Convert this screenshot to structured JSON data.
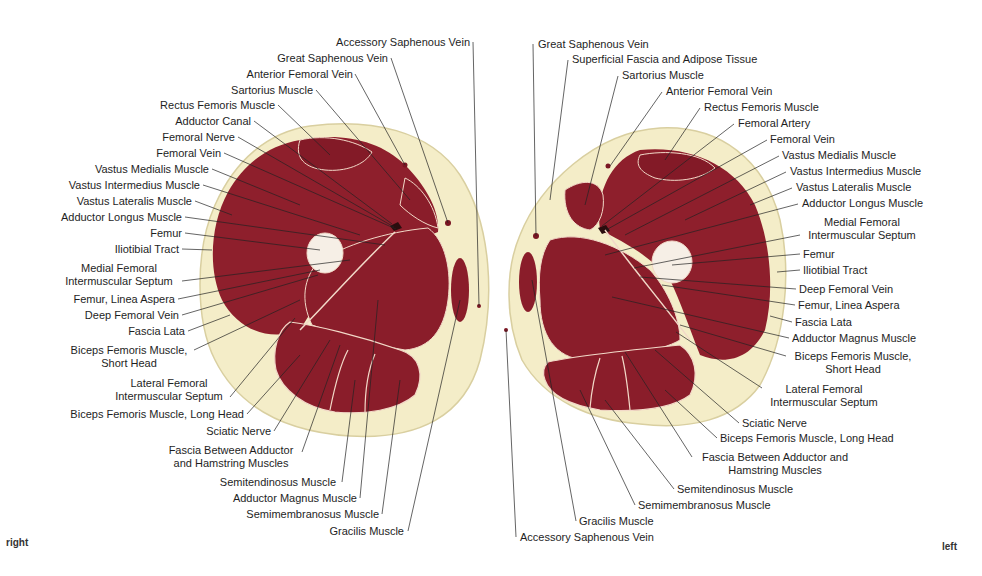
{
  "figure": {
    "side_labels": {
      "right": "right",
      "left": "left"
    },
    "colors": {
      "muscle": "#8e1f2c",
      "muscle_dark": "#7a1623",
      "fat": "#f4edc8",
      "fat_edge": "#d9cfa0",
      "bone": "#f6efe6",
      "septum": "#f2d9c8",
      "leader": "#222222"
    },
    "right_thigh": {
      "labels": [
        {
          "text": "Accessory Saphenous Vein",
          "x": 324,
          "y": 36,
          "align": "r",
          "w": 146
        },
        {
          "text": "Great Saphenous Vein",
          "x": 268,
          "y": 52,
          "align": "r",
          "w": 120
        },
        {
          "text": "Anterior Femoral Vein",
          "x": 237,
          "y": 68,
          "align": "r",
          "w": 116
        },
        {
          "text": "Sartorius Muscle",
          "x": 222,
          "y": 84,
          "align": "r",
          "w": 91
        },
        {
          "text": "Rectus Femoris Muscle",
          "x": 148,
          "y": 99,
          "align": "r",
          "w": 127
        },
        {
          "text": "Adductor Canal",
          "x": 167,
          "y": 115,
          "align": "r",
          "w": 84
        },
        {
          "text": "Femoral Nerve",
          "x": 155,
          "y": 131,
          "align": "r",
          "w": 80
        },
        {
          "text": "Femoral Vein",
          "x": 151,
          "y": 147,
          "align": "r",
          "w": 70
        },
        {
          "text": "Vastus Medialis Muscle",
          "x": 85,
          "y": 163,
          "align": "r",
          "w": 124
        },
        {
          "text": "Vastus Intermedius Muscle",
          "x": 57,
          "y": 179,
          "align": "r",
          "w": 143
        },
        {
          "text": "Vastus Lateralis Muscle",
          "x": 66,
          "y": 195,
          "align": "r",
          "w": 126
        },
        {
          "text": "Adductor Longus Muscle",
          "x": 51,
          "y": 211,
          "align": "r",
          "w": 131
        },
        {
          "text": "Femur",
          "x": 146,
          "y": 227,
          "align": "r",
          "w": 36
        },
        {
          "text": "Iliotibial Tract",
          "x": 111,
          "y": 243,
          "align": "r",
          "w": 68
        },
        {
          "text": "Medial Femoral\nIntermuscular Septum",
          "x": 60,
          "y": 262,
          "align": "c",
          "w": 118
        },
        {
          "text": "Femur, Linea Aspera",
          "x": 65,
          "y": 293,
          "align": "r",
          "w": 110
        },
        {
          "text": "Deep Femoral Vein",
          "x": 79,
          "y": 309,
          "align": "r",
          "w": 100
        },
        {
          "text": "Fascia Lata",
          "x": 124,
          "y": 325,
          "align": "r",
          "w": 61
        },
        {
          "text": "Biceps Femoris Muscle,\nShort Head",
          "x": 66,
          "y": 344,
          "align": "c",
          "w": 126
        },
        {
          "text": "Lateral Femoral\nIntermuscular Septum",
          "x": 110,
          "y": 377,
          "align": "c",
          "w": 118
        },
        {
          "text": "Biceps Femoris Muscle, Long Head",
          "x": 54,
          "y": 408,
          "align": "r",
          "w": 190
        },
        {
          "text": "Sciatic Nerve",
          "x": 199,
          "y": 425,
          "align": "r",
          "w": 72
        },
        {
          "text": "Fascia Between Adductor\nand Hamstring Muscles",
          "x": 163,
          "y": 444,
          "align": "c",
          "w": 136
        },
        {
          "text": "Semitendinosus Muscle",
          "x": 208,
          "y": 476,
          "align": "r",
          "w": 128
        },
        {
          "text": "Adductor Magnus Muscle",
          "x": 221,
          "y": 492,
          "align": "r",
          "w": 136
        },
        {
          "text": "Semimembranosus Muscle",
          "x": 234,
          "y": 508,
          "align": "r",
          "w": 145
        },
        {
          "text": "Gracilis Muscle",
          "x": 324,
          "y": 525,
          "align": "r",
          "w": 80
        }
      ]
    },
    "left_thigh": {
      "labels": [
        {
          "text": "Great Saphenous Vein",
          "x": 538,
          "y": 38,
          "align": "l",
          "w": 124
        },
        {
          "text": "Superficial Fascia and Adipose Tissue",
          "x": 572,
          "y": 53,
          "align": "l",
          "w": 208
        },
        {
          "text": "Sartorius Muscle",
          "x": 622,
          "y": 69,
          "align": "l",
          "w": 90
        },
        {
          "text": "Anterior Femoral Vein",
          "x": 666,
          "y": 85,
          "align": "l",
          "w": 118
        },
        {
          "text": "Rectus Femoris Muscle",
          "x": 704,
          "y": 101,
          "align": "l",
          "w": 124
        },
        {
          "text": "Femoral Artery",
          "x": 738,
          "y": 117,
          "align": "l",
          "w": 80
        },
        {
          "text": "Femoral Vein",
          "x": 770,
          "y": 133,
          "align": "l",
          "w": 70
        },
        {
          "text": "Vastus Medialis Muscle",
          "x": 782,
          "y": 149,
          "align": "l",
          "w": 124
        },
        {
          "text": "Vastus Intermedius Muscle",
          "x": 790,
          "y": 165,
          "align": "l",
          "w": 145
        },
        {
          "text": "Vastus Lateralis Muscle",
          "x": 796,
          "y": 181,
          "align": "l",
          "w": 126
        },
        {
          "text": "Adductor Longus Muscle",
          "x": 802,
          "y": 197,
          "align": "l",
          "w": 132
        },
        {
          "text": "Medial Femoral\nIntermuscular Septum",
          "x": 803,
          "y": 216,
          "align": "c",
          "w": 118
        },
        {
          "text": "Femur",
          "x": 803,
          "y": 248,
          "align": "l",
          "w": 36
        },
        {
          "text": "Iliotibial Tract",
          "x": 803,
          "y": 264,
          "align": "l",
          "w": 70
        },
        {
          "text": "Deep Femoral Vein",
          "x": 799,
          "y": 283,
          "align": "l",
          "w": 100
        },
        {
          "text": "Femur, Linea Aspera",
          "x": 798,
          "y": 299,
          "align": "l",
          "w": 112
        },
        {
          "text": "Fascia Lata",
          "x": 795,
          "y": 316,
          "align": "l",
          "w": 61
        },
        {
          "text": "Adductor Magnus Muscle",
          "x": 792,
          "y": 332,
          "align": "l",
          "w": 136
        },
        {
          "text": "Biceps Femoris Muscle,\nShort Head",
          "x": 789,
          "y": 350,
          "align": "c",
          "w": 128
        },
        {
          "text": "Lateral Femoral\nIntermuscular Septum",
          "x": 765,
          "y": 383,
          "align": "c",
          "w": 118
        },
        {
          "text": "Sciatic Nerve",
          "x": 742,
          "y": 417,
          "align": "l",
          "w": 72
        },
        {
          "text": "Biceps Femoris Muscle, Long Head",
          "x": 720,
          "y": 432,
          "align": "l",
          "w": 190
        },
        {
          "text": "Fascia Between Adductor and\nHamstring Muscles",
          "x": 695,
          "y": 451,
          "align": "c",
          "w": 160
        },
        {
          "text": "Semitendinosus Muscle",
          "x": 677,
          "y": 483,
          "align": "l",
          "w": 128
        },
        {
          "text": "Semimembranosus Muscle",
          "x": 638,
          "y": 499,
          "align": "l",
          "w": 145
        },
        {
          "text": "Gracilis Muscle",
          "x": 579,
          "y": 515,
          "align": "l",
          "w": 82
        },
        {
          "text": "Accessory Saphenous Vein",
          "x": 520,
          "y": 531,
          "align": "l",
          "w": 148
        }
      ]
    }
  }
}
